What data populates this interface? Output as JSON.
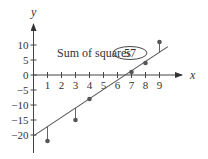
{
  "chart_data": {
    "type": "scatter",
    "title": "",
    "xlabel": "x",
    "ylabel": "y",
    "xlim": [
      0,
      10
    ],
    "ylim": [
      -25,
      15
    ],
    "grid": false,
    "x_ticks": [
      1,
      2,
      3,
      4,
      5,
      6,
      7,
      8,
      9
    ],
    "y_ticks": [
      10,
      5,
      0,
      -5,
      -10,
      -15,
      -20
    ],
    "points": [
      {
        "x": 1,
        "y": -22
      },
      {
        "x": 3,
        "y": -15
      },
      {
        "x": 4,
        "y": -8
      },
      {
        "x": 7,
        "y": 1
      },
      {
        "x": 8,
        "y": 4
      },
      {
        "x": 9,
        "y": 11
      }
    ],
    "regression_line": {
      "slope": 3.1,
      "intercept": -20.3,
      "x_start": 0,
      "x_end": 9.6
    },
    "residuals_shown": true,
    "annotation": {
      "label": "Sum of squares",
      "value": "57"
    },
    "colors": {
      "axis": "#444444",
      "line": "#555555",
      "point": "#555555",
      "text": "#333333"
    }
  }
}
